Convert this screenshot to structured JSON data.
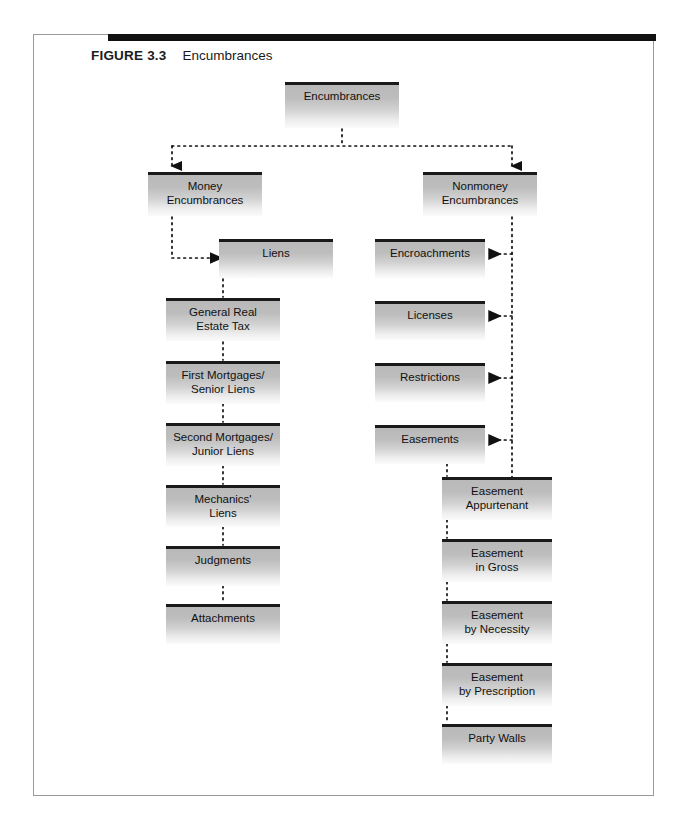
{
  "figure": {
    "label": "FIGURE 3.3",
    "title": "Encumbrances"
  },
  "diagram": {
    "type": "hierarchy-flowchart",
    "root": {
      "label": "Encumbrances"
    },
    "branches": [
      {
        "label": "Money\nEncumbrances",
        "head": {
          "label": "Liens"
        },
        "children": [
          {
            "label": "General Real\nEstate Tax"
          },
          {
            "label": "First Mortgages/\nSenior Liens"
          },
          {
            "label": "Second Mortgages/\nJunior Liens"
          },
          {
            "label": "Mechanics'\nLiens"
          },
          {
            "label": "Judgments"
          },
          {
            "label": "Attachments"
          }
        ]
      },
      {
        "label": "Nonmoney\nEncumbrances",
        "children": [
          {
            "label": "Encroachments"
          },
          {
            "label": "Licenses"
          },
          {
            "label": "Restrictions"
          },
          {
            "label": "Easements"
          }
        ],
        "sub": {
          "parent": "Easements",
          "children": [
            {
              "label": "Easement\nAppurtenant"
            },
            {
              "label": "Easement\nin Gross"
            },
            {
              "label": "Easement\nby Necessity"
            },
            {
              "label": "Easement\nby Prescription"
            },
            {
              "label": "Party Walls"
            }
          ]
        }
      }
    ]
  },
  "colors": {
    "box_top_border": "#1a1a1a",
    "box_fill_top": "#b9b9b9",
    "box_fill_bottom": "#fbfbfb",
    "connector": "#111111",
    "card_border": "#9a9a9a",
    "card_topbar": "#111111"
  }
}
